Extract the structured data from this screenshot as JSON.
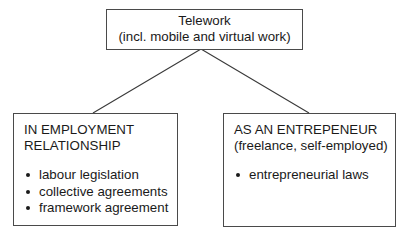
{
  "diagram": {
    "type": "tree",
    "root": {
      "title": "Telework",
      "subtitle": "(incl. mobile and virtual work)"
    },
    "children": [
      {
        "heading_line1": "IN EMPLOYMENT",
        "heading_line2": "RELATIONSHIP",
        "items": [
          "labour legislation",
          "collective agreements",
          "framework agreement"
        ]
      },
      {
        "heading_line1": "AS AN ENTREPENEUR",
        "heading_line2": "(freelance, self-employed)",
        "items": [
          "entrepreneurial laws"
        ]
      }
    ],
    "colors": {
      "border": "#4a4a4a",
      "text": "#1a1a1a",
      "background": "#ffffff"
    }
  }
}
